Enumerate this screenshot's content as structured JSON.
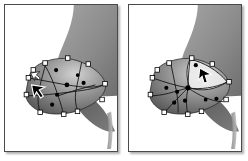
{
  "figure": {
    "kind": "before-after-comparison",
    "panel_count": 2,
    "background_color": "#ffffff",
    "frame_border_color": "#4a4a4a",
    "shadow_color": "#808080"
  },
  "panels": [
    {
      "id": "before",
      "name": "left-panel",
      "caption": "",
      "state_label": "before-edit",
      "artwork": {
        "subject": "fan-propeller-hub",
        "style": "grayscale-photo-with-vector-mesh-overlay",
        "blade_top_color": "#8e8e8e",
        "blade_bottom_color": "#6b6b6b",
        "hub_light_color": "#c9c9c9",
        "hub_dark_color": "#5a5a5a",
        "mesh_line_color": "#1a1a1a",
        "anchor_fill": "#ffffff",
        "anchor_stroke": "#000000",
        "node_fill": "#000000"
      },
      "mesh": {
        "anchor_points": [
          [
            24,
            74
          ],
          [
            40,
            60
          ],
          [
            62,
            55
          ],
          [
            82,
            62
          ],
          [
            98,
            76
          ],
          [
            100,
            92
          ],
          [
            86,
            104
          ],
          [
            60,
            110
          ],
          [
            36,
            106
          ],
          [
            22,
            92
          ]
        ],
        "interior_nodes": [
          [
            52,
            66
          ],
          [
            62,
            80
          ],
          [
            70,
            90
          ],
          [
            46,
            88
          ],
          [
            80,
            78
          ],
          [
            44,
            98
          ],
          [
            58,
            96
          ]
        ],
        "selected_node": [
          52,
          84
        ],
        "anchor_count": 10,
        "interior_node_count": 7
      },
      "cursors": [
        {
          "type": "arrow-cursor",
          "x": 33,
          "y": 86,
          "rotation": -20
        },
        {
          "type": "arrow-cursor-small",
          "x": 29,
          "y": 74,
          "rotation": -55
        }
      ]
    },
    {
      "id": "after",
      "name": "right-panel",
      "caption": "",
      "state_label": "after-edit",
      "artwork": {
        "subject": "fan-propeller-hub",
        "style": "grayscale-photo-with-vector-mesh-overlay",
        "blade_top_color": "#8e8e8e",
        "blade_bottom_color": "#6b6b6b",
        "hub_light_color": "#c9c9c9",
        "hub_dark_color": "#5a5a5a",
        "mesh_line_color": "#1a1a1a",
        "anchor_fill": "#ffffff",
        "anchor_stroke": "#000000",
        "node_fill": "#000000",
        "highlight_region_fill": "#f2f2f2"
      },
      "mesh": {
        "anchor_points": [
          [
            24,
            74
          ],
          [
            40,
            60
          ],
          [
            62,
            55
          ],
          [
            82,
            62
          ],
          [
            98,
            76
          ],
          [
            100,
            92
          ],
          [
            86,
            104
          ],
          [
            60,
            110
          ],
          [
            36,
            106
          ],
          [
            22,
            92
          ]
        ],
        "interior_nodes": [
          [
            52,
            66
          ],
          [
            62,
            80
          ],
          [
            70,
            90
          ],
          [
            46,
            88
          ],
          [
            80,
            78
          ],
          [
            44,
            98
          ],
          [
            58,
            96
          ]
        ],
        "selected_node": [
          52,
          84
        ],
        "anchor_count": 10,
        "interior_node_count": 7,
        "highlight_triangle": [
          [
            62,
            55
          ],
          [
            98,
            80
          ],
          [
            52,
            84
          ]
        ]
      },
      "cursors": [
        {
          "type": "arrow-cursor",
          "x": 75,
          "y": 76,
          "rotation": 0
        }
      ]
    }
  ],
  "icons": {
    "arrow_cursor": "arrow-cursor-icon",
    "mesh_anchor": "mesh-anchor-point-icon",
    "mesh_node": "mesh-node-icon"
  }
}
